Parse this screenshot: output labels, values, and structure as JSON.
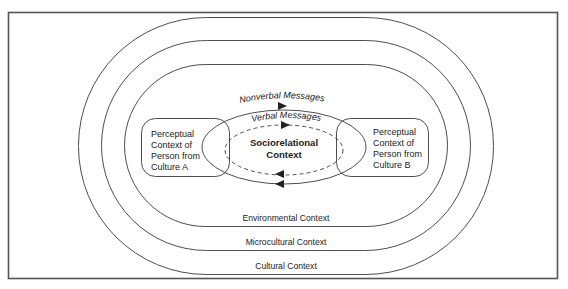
{
  "diagram": {
    "contexts": {
      "cultural": "Cultural Context",
      "microcultural": "Microcultural Context",
      "environmental": "Environmental Context"
    },
    "person_a": {
      "lines": [
        "Perceptual",
        "Context of",
        "Person from",
        "Culture A"
      ]
    },
    "person_b": {
      "lines": [
        "Perceptual",
        "Context of",
        "Person from",
        "Culture B"
      ]
    },
    "messages": {
      "nonverbal": "Nonverbal Messages",
      "verbal": "Verbal Messages"
    },
    "center": {
      "lines": [
        "Sociorelational",
        "Context"
      ]
    },
    "colors": {
      "stroke": "#3a3a3a",
      "frame": "#555555",
      "text": "#222222",
      "background": "#ffffff"
    }
  }
}
